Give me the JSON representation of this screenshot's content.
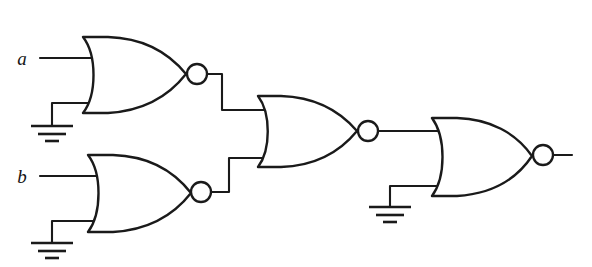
{
  "figure": {
    "background_color": "#ffffff",
    "line_color": "#1a1a1a"
  },
  "inputs": [
    {
      "id": "input-a",
      "label": "a",
      "label_x": 22,
      "label_y": 65,
      "wire_y": 58,
      "wire_x1": 40,
      "wire_x2": 92
    },
    {
      "id": "input-b",
      "label": "b",
      "label_x": 22,
      "label_y": 183,
      "wire_y": 176,
      "wire_x1": 40,
      "wire_x2": 96
    }
  ],
  "gates": [
    {
      "id": "gate-1",
      "type": "NOR",
      "name": "nor-gate-top-left",
      "back_x": 83,
      "top_y": 37,
      "bottom_y": 113,
      "tip_x": 186,
      "mid_y": 75,
      "bubble_cx": 197,
      "bubble_cy": 74,
      "bubble_r": 10
    },
    {
      "id": "gate-2",
      "type": "NOR",
      "name": "nor-gate-bottom-left",
      "back_x": 88,
      "top_y": 155,
      "bottom_y": 232,
      "tip_x": 190,
      "mid_y": 193,
      "bubble_cx": 201,
      "bubble_cy": 192,
      "bubble_r": 10
    },
    {
      "id": "gate-3",
      "type": "NOR",
      "name": "nor-gate-middle",
      "back_x": 258,
      "top_y": 96,
      "bottom_y": 167,
      "tip_x": 357,
      "mid_y": 131,
      "bubble_cx": 368,
      "bubble_cy": 131,
      "bubble_r": 10
    },
    {
      "id": "gate-4",
      "type": "NOR",
      "name": "nor-gate-output",
      "back_x": 432,
      "top_y": 118,
      "bottom_y": 196,
      "tip_x": 532,
      "mid_y": 156,
      "bubble_cx": 543,
      "bubble_cy": 155,
      "bubble_r": 10
    }
  ],
  "grounds": [
    {
      "id": "ground-1",
      "name": "ground-symbol-gate1",
      "stem_x": 52,
      "stem_top_y": 103,
      "bar_y": 126,
      "wire_to_x": 92,
      "wire_y": 103
    },
    {
      "id": "ground-2",
      "name": "ground-symbol-gate2",
      "stem_x": 52,
      "stem_top_y": 221,
      "bar_y": 243,
      "wire_to_x": 96,
      "wire_y": 221
    },
    {
      "id": "ground-3",
      "name": "ground-symbol-gate4",
      "stem_x": 390,
      "stem_top_y": 186,
      "bar_y": 207,
      "wire_to_x": 440,
      "wire_y": 186
    }
  ],
  "connections": [
    {
      "id": "wire-g1-to-g3",
      "name": "wire-gate1-output-to-gate3-input",
      "points": "207,74 222,74 222,110 266,110"
    },
    {
      "id": "wire-g2-to-g3",
      "name": "wire-gate2-output-to-gate3-input",
      "points": "211,192 229,192 229,158 266,158"
    },
    {
      "id": "wire-g3-to-g4",
      "name": "wire-gate3-output-to-gate4-input",
      "points": "378,131 441,131"
    },
    {
      "id": "wire-output",
      "name": "wire-circuit-output",
      "points": "553,155 572,155"
    }
  ],
  "output": {
    "id": "output-wire",
    "label": "",
    "x1": 553,
    "x2": 572,
    "y": 155
  }
}
